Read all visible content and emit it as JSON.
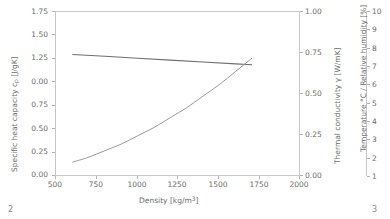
{
  "chart_data": {
    "type": "line",
    "title": "",
    "xlabel": "Density [kg/m³]",
    "xlabel_base": "Density [kg/m",
    "xlabel_sup": "3",
    "xlabel_end": "]",
    "xlim": [
      500,
      2000
    ],
    "xticks": [
      "500",
      "750",
      "1000",
      "1250",
      "1500",
      "1750",
      "2000"
    ],
    "xtick_values": [
      500,
      750,
      1000,
      1250,
      1500,
      1750,
      2000
    ],
    "grid": false,
    "legend": "none",
    "axes": [
      {
        "id": "left",
        "label_base": "Specific heat capacity c",
        "label_sub": "p",
        "label_end": " [J/gK]",
        "label": "Specific heat capacity c_p [J/gK]",
        "lim": [
          0.0,
          1.75
        ],
        "ticks": [
          "0.00",
          "0.25",
          "0.50",
          "0.75",
          "0.00",
          "1.25",
          "1.50",
          "1.75"
        ],
        "tick_values": [
          0.0,
          0.25,
          0.5,
          0.75,
          1.0,
          1.25,
          1.5,
          1.75
        ]
      },
      {
        "id": "right",
        "label": "Thermal conductivity γ [W/mK]",
        "lim": [
          0.0,
          1.0
        ],
        "ticks": [
          "0.00",
          "0.25",
          "0.50",
          "0.75",
          "1.00"
        ],
        "tick_values": [
          0.0,
          0.25,
          0.5,
          0.75,
          1.0
        ]
      },
      {
        "id": "far-right",
        "label": "Temperature °C / Relative humidity [%]",
        "lim": [
          0,
          10
        ],
        "ticks": [
          "1",
          "2",
          "3",
          "4",
          "5",
          "6",
          "7",
          "8",
          "9",
          "10"
        ],
        "tick_values": [
          1,
          2,
          3,
          4,
          5,
          6,
          7,
          8,
          9,
          10
        ]
      }
    ],
    "series": [
      {
        "name": "Specific heat capacity",
        "axis": "left",
        "color": "#6e6e6e",
        "x": [
          600,
          800,
          1000,
          1200,
          1400,
          1600,
          1700
        ],
        "values": [
          1.3,
          1.28,
          1.26,
          1.24,
          1.22,
          1.2,
          1.19
        ]
      },
      {
        "name": "Thermal conductivity",
        "axis": "right",
        "color": "#9a9a9a",
        "x": [
          600,
          700,
          800,
          900,
          1000,
          1100,
          1200,
          1300,
          1400,
          1500,
          1600,
          1700
        ],
        "values": [
          0.09,
          0.12,
          0.16,
          0.2,
          0.25,
          0.3,
          0.36,
          0.42,
          0.49,
          0.56,
          0.64,
          0.72
        ]
      }
    ]
  },
  "page": {
    "number_left": "2",
    "number_right": "3"
  }
}
